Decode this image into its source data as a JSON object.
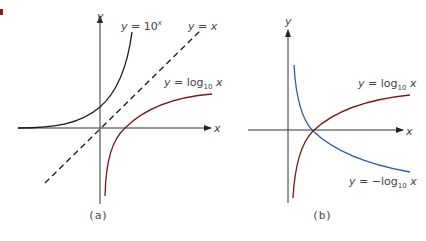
{
  "figure": {
    "marker_color": "#8b1a1a",
    "panels": [
      {
        "caption": "(a)",
        "axes": {
          "x_label": "x",
          "y_label": "y"
        },
        "curves": [
          {
            "name": "exponential",
            "label_prefix": "y = 10",
            "label_sup": "x",
            "color": "#1a1a1a",
            "style": "solid"
          },
          {
            "name": "identity",
            "label": "y = x",
            "color": "#1a1a1a",
            "style": "dashed"
          },
          {
            "name": "log10",
            "label_prefix": "y = log",
            "label_sub": "10",
            "label_suffix": " x",
            "color": "#7a1a1a",
            "style": "solid"
          }
        ]
      },
      {
        "caption": "(b)",
        "axes": {
          "x_label": "x",
          "y_label": "y"
        },
        "curves": [
          {
            "name": "log10",
            "label_prefix": "y = log",
            "label_sub": "10",
            "label_suffix": " x",
            "color": "#7a1a1a",
            "style": "solid"
          },
          {
            "name": "neg-log10",
            "label_prefix": "y = −log",
            "label_sub": "10",
            "label_suffix": " x",
            "color": "#2a5db0",
            "style": "solid"
          }
        ]
      }
    ]
  }
}
